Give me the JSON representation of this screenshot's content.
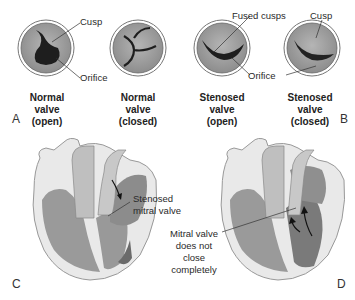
{
  "figure": {
    "panels": {
      "A": "A",
      "B": "B",
      "C": "C",
      "D": "D"
    },
    "valves": [
      {
        "id": "normal-open",
        "caption": [
          "Normal",
          "valve",
          "(open)"
        ]
      },
      {
        "id": "normal-closed",
        "caption": [
          "Normal",
          "valve",
          "(closed)"
        ]
      },
      {
        "id": "stenosed-open",
        "caption": [
          "Stenosed",
          "valve",
          "(open)"
        ]
      },
      {
        "id": "stenosed-closed",
        "caption": [
          "Stenosed",
          "valve",
          "(closed)"
        ]
      }
    ],
    "labels": {
      "cusp_a": "Cusp",
      "orifice_a": "Orifice",
      "fused_cusps": "Fused cusps",
      "cusp_b": "Cusp",
      "orifice_b": "Orifice",
      "stenosed_mitral": [
        "Stenosed",
        "mitral valve"
      ],
      "mitral_not_close": [
        "Mitral valve",
        "does not",
        "close",
        "completely"
      ]
    },
    "colors": {
      "valve_ring": "#b0b0b0",
      "valve_fill": "#9a9a9a",
      "orifice": "#1a1a1a",
      "heart_light": "#c8c8c8",
      "heart_mid": "#a8a8a8",
      "heart_dark": "#7a7a7a"
    }
  }
}
